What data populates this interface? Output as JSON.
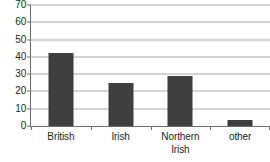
{
  "chart_data": {
    "type": "bar",
    "title": "",
    "subtitle": "",
    "xlabel": "",
    "ylabel": "",
    "categories": [
      "British",
      "Irish",
      "Northern Irish",
      "other"
    ],
    "category_lines": [
      [
        "British"
      ],
      [
        "Irish"
      ],
      [
        "Northern",
        "Irish"
      ],
      [
        "other"
      ]
    ],
    "values": [
      42,
      25,
      29,
      3.5
    ],
    "series": [
      {
        "name": "",
        "values": [
          42,
          25,
          29,
          3.5
        ]
      }
    ],
    "ylim": [
      0,
      70
    ],
    "ytick_step": 10,
    "yticks": [
      0,
      10,
      20,
      30,
      40,
      50,
      60,
      70
    ],
    "ytick_labels": [
      "0",
      "10",
      "20",
      "30",
      "40",
      "50",
      "60",
      "70"
    ],
    "grid": "horizontal",
    "legend": "none",
    "bar_color": "#3f3f3f",
    "gridline_color": "#a7a9ac",
    "axis_color": "#6d6e71",
    "background_color": "#ffffff",
    "text_color": "#231f20"
  }
}
